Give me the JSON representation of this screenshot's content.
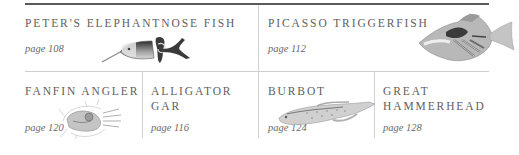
{
  "entries": [
    {
      "title": "PETER'S ELEPHANTNOSE FISH",
      "page": "page 108",
      "illustration": "elephantnose-fish-illustration"
    },
    {
      "title": "PICASSO TRIGGERFISH",
      "page": "page 112",
      "illustration": "triggerfish-illustration"
    },
    {
      "title": "FANFIN ANGLER",
      "page": "page 120",
      "illustration": "angler-illustration"
    },
    {
      "title_line1": "ALLIGATOR",
      "title_line2": "GAR",
      "page": "page 116"
    },
    {
      "title": "BURBOT",
      "page": "page 124",
      "illustration": "burbot-illustration"
    },
    {
      "title_line1": "GREAT",
      "title_line2": "HAMMERHEAD",
      "page": "page 128"
    }
  ],
  "colors": {
    "top_rule": "#5a5a5a",
    "divider": "#d2d2d2",
    "title_text": "#5e5e5e",
    "page_text": "#6a6a6a"
  }
}
